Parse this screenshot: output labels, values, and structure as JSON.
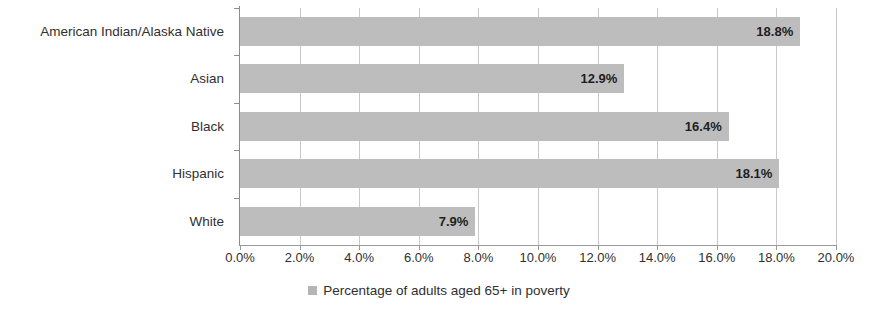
{
  "chart_data": {
    "type": "bar",
    "orientation": "horizontal",
    "title": "",
    "subtitle": "",
    "xlabel": "",
    "ylabel": "",
    "categories": [
      "American Indian/Alaska Native",
      "Asian",
      "Black",
      "Hispanic",
      "White"
    ],
    "series": [
      {
        "name": "Percentage of adults aged 65+ in poverty",
        "values": [
          18.8,
          18.1,
          16.4,
          12.9,
          7.9
        ],
        "color": "#bdbdbd"
      }
    ],
    "values_by_category": {
      "American Indian/Alaska Native": 18.8,
      "Asian": 12.9,
      "Black": 16.4,
      "Hispanic": 18.1,
      "White": 7.9
    },
    "data_labels": [
      "18.8%",
      "12.9%",
      "16.4%",
      "18.1%",
      "7.9%"
    ],
    "xlim": [
      0,
      20
    ],
    "xtick_step": 2,
    "xticks": [
      0,
      2,
      4,
      6,
      8,
      10,
      12,
      14,
      16,
      18,
      20
    ],
    "xtick_labels": [
      "0.0%",
      "2.0%",
      "4.0%",
      "6.0%",
      "8.0%",
      "10.0%",
      "12.0%",
      "14.0%",
      "16.0%",
      "18.0%",
      "20.0%"
    ],
    "grid": {
      "vertical": true,
      "horizontal": false
    },
    "legend": {
      "position": "bottom",
      "entries": [
        {
          "label": "Percentage of adults aged 65+ in poverty",
          "color": "#bdbdbd"
        }
      ]
    }
  },
  "legend": {
    "marker_name": "legend-color-swatch",
    "label": "Percentage of adults aged 65+ in poverty"
  }
}
